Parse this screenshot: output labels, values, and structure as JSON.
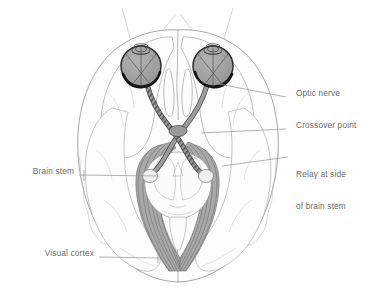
{
  "figure": {
    "view": "horizontal section of the brain seen from below",
    "colors": {
      "outline": "#8d8d8d",
      "label_text": "#6b6b6b",
      "leader_line": "#9a9a9a",
      "eye_fill": "#9e9e9e",
      "eye_outline": "#3a3a3a",
      "retina_arc": "#1f1f1f",
      "nerve_fill": "#8f8f8f",
      "nerve_outline": "#4a4a4a",
      "cortex_fill": "#a8a8a8",
      "cortex_stripe": "#6e6e6e",
      "brain_fill": "#fdfdfd",
      "sight_line": "#bdbdbd",
      "relay_fill": "#e8e8e8"
    }
  },
  "labels": [
    {
      "id": "optic-nerve",
      "text": "Optic nerve",
      "side": "right",
      "x": 296,
      "y": 93,
      "leader": {
        "x1": 286,
        "y1": 97,
        "x2": 214,
        "y2": 83
      }
    },
    {
      "id": "crossover-point",
      "text": "Crossover point",
      "side": "right",
      "x": 296,
      "y": 125,
      "leader": {
        "x1": 286,
        "y1": 129,
        "x2": 201,
        "y2": 133
      }
    },
    {
      "id": "relay-at-side-of-brain-stem",
      "text": "Relay at side\nof brain stem",
      "line1": "Relay at side",
      "line2": "of brain stem",
      "side": "right",
      "x": 296,
      "y": 153,
      "leader": {
        "x1": 288,
        "y1": 157,
        "x2": 222,
        "y2": 166
      }
    },
    {
      "id": "brain-stem",
      "text": "Brain stem",
      "side": "left",
      "x": 22,
      "y": 171,
      "leader": {
        "x1": 79,
        "y1": 175,
        "x2": 159,
        "y2": 176
      }
    },
    {
      "id": "visual-cortex",
      "text": "Visual cortex",
      "side": "left",
      "x": 32,
      "y": 253,
      "leader": {
        "x1": 99,
        "y1": 257,
        "x2": 160,
        "y2": 258
      }
    }
  ],
  "anatomy": {
    "eyes": [
      {
        "id": "left-eye",
        "cx": 141,
        "cy": 66,
        "r": 20
      },
      {
        "id": "right-eye",
        "cx": 213,
        "cy": 66,
        "r": 20
      }
    ],
    "chiasm": {
      "id": "optic-chiasm",
      "cx": 178,
      "cy": 131
    },
    "relay_bodies": [
      {
        "id": "left-relay",
        "cx": 151,
        "cy": 176
      },
      {
        "id": "right-relay",
        "cx": 204,
        "cy": 176
      }
    ],
    "visual_field_lines": 4
  }
}
